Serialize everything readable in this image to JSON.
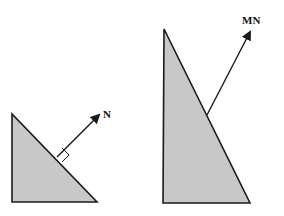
{
  "diagram": {
    "left": {
      "force_label": "N",
      "triangle": [
        [
          12,
          114
        ],
        [
          12,
          202
        ],
        [
          97,
          202
        ]
      ],
      "arrow": {
        "from": [
          57,
          157
        ],
        "to": [
          99,
          115
        ]
      },
      "right_angle_marker": true,
      "label_pos": [
        103,
        114
      ]
    },
    "right": {
      "force_label": "MN",
      "triangle": [
        [
          164,
          29
        ],
        [
          163,
          203
        ],
        [
          250,
          203
        ]
      ],
      "arrow": {
        "from": [
          207,
          115
        ],
        "to": [
          250,
          32
        ]
      },
      "right_angle_marker": false,
      "label_pos": [
        242,
        22
      ]
    },
    "colors": {
      "fill": "#c8c8c8",
      "stroke": "#1a1a1a",
      "background": "#ffffff"
    }
  }
}
